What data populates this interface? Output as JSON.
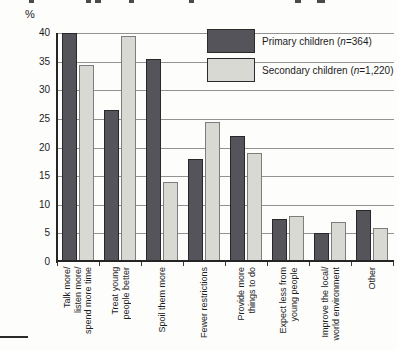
{
  "chart_data": {
    "type": "bar",
    "ylabel": "%",
    "ylim": [
      0,
      40
    ],
    "ytick_step": 5,
    "ytick_labels": [
      "40",
      "35",
      "30",
      "25",
      "20",
      "15",
      "10",
      "5",
      "0"
    ],
    "grid": true,
    "legend_position": "top-right-inside",
    "categories": [
      "Talk more/\nlisten more/\nspend more time",
      "Treat young\npeople better",
      "Spoil them more",
      "Fewer restrictions",
      "Provide more\nthings to do",
      "Expect less from\nyoung people",
      "Improve the local/\nworld environment",
      "Other"
    ],
    "series": [
      {
        "name": "Primary children (n=364)",
        "color": "#54545a",
        "border": "#27272c",
        "values": [
          40,
          26.5,
          35.5,
          18,
          22,
          7.5,
          5,
          9
        ]
      },
      {
        "name": "Secondary children (n=1,220)",
        "color": "#d9d9d4",
        "border": "#7d7d7d",
        "values": [
          34.5,
          39.5,
          14,
          24.5,
          19,
          8,
          7,
          6
        ]
      }
    ]
  },
  "legend": {
    "items": [
      {
        "prefix": "Primary children (",
        "n": "n",
        "suffix": "=364)"
      },
      {
        "prefix": "Secondary children (",
        "n": "n",
        "suffix": "=1,220)"
      }
    ]
  },
  "colors": {
    "gridline": "#929292",
    "axis": "#252525",
    "text": "#1c1c1c"
  }
}
